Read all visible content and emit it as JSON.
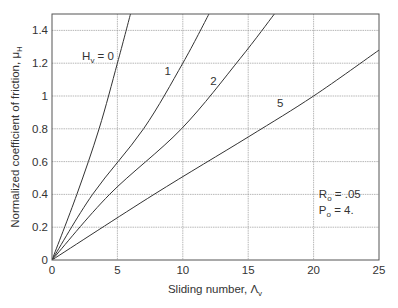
{
  "chart_data": {
    "type": "line",
    "title": "",
    "xlabel": "Sliding number, Λ",
    "xlabel_sub": "v",
    "ylabel": "Normalized coefficient of friction, μ",
    "ylabel_sub": "H",
    "xlim": [
      0,
      25
    ],
    "ylim": [
      0,
      1.5
    ],
    "xticks": [
      0,
      5,
      10,
      15,
      20,
      25
    ],
    "xtick_labels": [
      "0",
      "5",
      "10",
      "15",
      "20",
      "25"
    ],
    "yticks": [
      0,
      0.2,
      0.4,
      0.6,
      0.8,
      1.0,
      1.2,
      1.4
    ],
    "ytick_labels": [
      "0",
      "0.2",
      "0.4",
      "0.6",
      "0.8",
      "1",
      "1.2",
      "1.4"
    ],
    "grid": true,
    "legend_position": "inline curve labels",
    "series": [
      {
        "name": "Hv = 0",
        "label": "H",
        "label_sub": "v",
        "label_suffix": " = 0",
        "label_pos": [
          2.3,
          1.22
        ],
        "x": [
          0,
          1.9,
          3.6,
          5.0,
          6.0
        ],
        "y": [
          0,
          0.4,
          0.8,
          1.2,
          1.5
        ]
      },
      {
        "name": "Hv = 1",
        "label": "1",
        "label_pos": [
          8.6,
          1.13
        ],
        "x": [
          0,
          3.1,
          7.0,
          10.0,
          12.0
        ],
        "y": [
          0,
          0.4,
          0.8,
          1.2,
          1.5
        ]
      },
      {
        "name": "Hv = 2",
        "label": "2",
        "label_pos": [
          12.1,
          1.07
        ],
        "x": [
          0,
          4.4,
          9.9,
          14.4,
          17.0
        ],
        "y": [
          0,
          0.4,
          0.8,
          1.23,
          1.5
        ]
      },
      {
        "name": "Hv = 5",
        "label": "5",
        "label_pos": [
          17.2,
          0.93
        ],
        "x": [
          0,
          7.8,
          15.0,
          20.0,
          25.0
        ],
        "y": [
          0,
          0.4,
          0.75,
          1.0,
          1.28
        ]
      }
    ],
    "annotations": [
      {
        "text": "R",
        "sub": "o",
        "suffix": " = .05",
        "pos": [
          20.4,
          0.38
        ]
      },
      {
        "text": "P",
        "sub": "o",
        "suffix": " = 4.",
        "pos": [
          20.4,
          0.28
        ]
      }
    ]
  },
  "colors": {
    "axis": "#555555",
    "grid": "#9a9a9a",
    "curve": "#333333",
    "text": "#333333"
  }
}
